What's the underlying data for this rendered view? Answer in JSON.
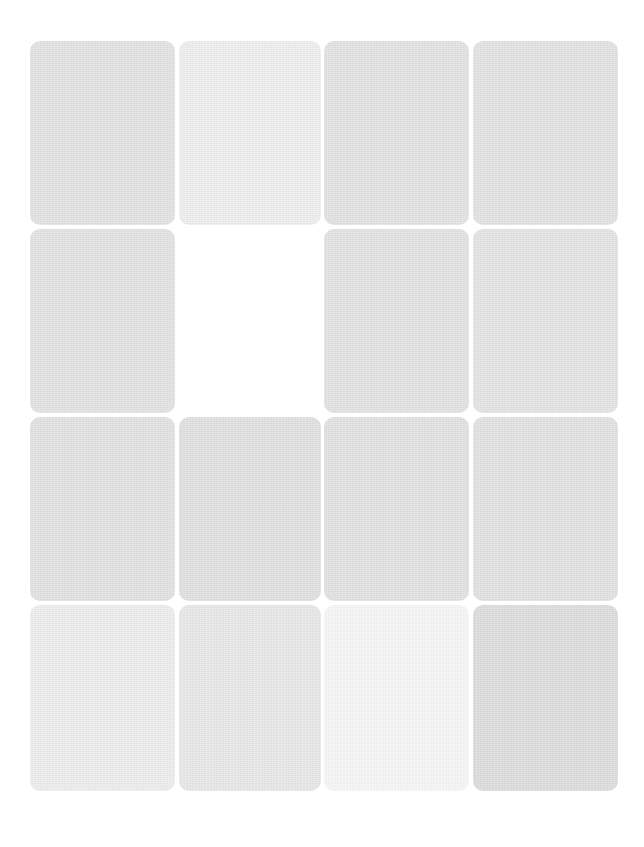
{
  "game": {
    "type": "memory-match",
    "rows": 4,
    "columns": 4,
    "background": "#ffffff"
  },
  "cards": [
    {
      "row": 1,
      "col": 1,
      "state": "face-down",
      "color": "#e3e3e3"
    },
    {
      "row": 1,
      "col": 2,
      "state": "face-down",
      "color": "#efefef"
    },
    {
      "row": 1,
      "col": 3,
      "state": "face-down",
      "color": "#e3e3e3"
    },
    {
      "row": 1,
      "col": 4,
      "state": "face-down",
      "color": "#e3e3e3"
    },
    {
      "row": 2,
      "col": 1,
      "state": "face-down",
      "color": "#e3e3e3"
    },
    {
      "row": 2,
      "col": 2,
      "state": "empty",
      "color": "#ffffff"
    },
    {
      "row": 2,
      "col": 3,
      "state": "face-down",
      "color": "#e3e3e3"
    },
    {
      "row": 2,
      "col": 4,
      "state": "face-down",
      "color": "#e4e4e4"
    },
    {
      "row": 3,
      "col": 1,
      "state": "face-down",
      "color": "#e2e2e2"
    },
    {
      "row": 3,
      "col": 2,
      "state": "face-down",
      "color": "#e1e1e1"
    },
    {
      "row": 3,
      "col": 3,
      "state": "face-down",
      "color": "#e2e2e2"
    },
    {
      "row": 3,
      "col": 4,
      "state": "face-down",
      "color": "#e2e2e2"
    },
    {
      "row": 4,
      "col": 1,
      "state": "face-down",
      "color": "#eeeeee"
    },
    {
      "row": 4,
      "col": 2,
      "state": "face-down",
      "color": "#e8e8e8"
    },
    {
      "row": 4,
      "col": 3,
      "state": "face-down",
      "color": "#f7f7f7"
    },
    {
      "row": 4,
      "col": 4,
      "state": "face-down",
      "color": "#dddddd"
    }
  ]
}
